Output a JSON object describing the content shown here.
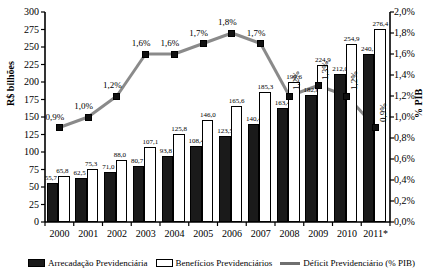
{
  "chart_data": {
    "type": "bar",
    "title": "",
    "xlabel": "",
    "ylabel": "R$ bilhões",
    "y2label": "% PIB",
    "categories": [
      "2000",
      "2001",
      "2002",
      "2003",
      "2004",
      "2005",
      "2006",
      "2007",
      "2008",
      "2009",
      "2010",
      "2011*"
    ],
    "ylim": [
      0,
      300
    ],
    "y2lim": [
      0,
      2.0
    ],
    "yticks": [
      "0",
      "25",
      "50",
      "75",
      "100",
      "125",
      "150",
      "175",
      "200",
      "225",
      "250",
      "275",
      "300"
    ],
    "y2ticks": [
      "0,0%",
      "0,2%",
      "0,4%",
      "0,6%",
      "0,8%",
      "1,0%",
      "1,2%",
      "1,4%",
      "1,6%",
      "1,8%",
      "2,0%"
    ],
    "grid": false,
    "legend_position": "bottom",
    "series": [
      {
        "name": "Arrecadação Previdenciária",
        "type": "bar",
        "color": "#1a1a1a",
        "axis": "left",
        "values": [
          55.7,
          62.5,
          71.0,
          80.7,
          93.8,
          108.4,
          123.5,
          140.4,
          163.4,
          182.0,
          212.0,
          240.1
        ],
        "labels": [
          "55,7",
          "62,5",
          "71,0",
          "80,7",
          "93,8",
          "108,4",
          "123,5",
          "140,4",
          "163,4",
          "182,0",
          "212,0",
          "240,1"
        ]
      },
      {
        "name": "Benefícios Previdenciários",
        "type": "bar",
        "color": "#ffffff",
        "axis": "left",
        "values": [
          65.8,
          75.3,
          88.0,
          107.1,
          125.8,
          146.0,
          165.6,
          185.3,
          199.6,
          224.9,
          254.9,
          276.4
        ],
        "labels": [
          "65,8",
          "75,3",
          "88,0",
          "107,1",
          "125,8",
          "146,0",
          "165,6",
          "185,3",
          "199,6",
          "224,9",
          "254,9",
          "276,4"
        ]
      },
      {
        "name": "Déficit Previdenciário (% PIB)",
        "type": "line",
        "color": "#808080",
        "axis": "right",
        "values": [
          0.9,
          1.0,
          1.2,
          1.6,
          1.6,
          1.7,
          1.8,
          1.7,
          1.2,
          1.3,
          1.2,
          0.9
        ],
        "labels": [
          "0,9%",
          "1,0%",
          "1,2%",
          "1,6%",
          "1,6%",
          "1,7%",
          "1,8%",
          "1,7%",
          "1,2%",
          "1,3%",
          "1,2%",
          "0,9%"
        ]
      }
    ]
  }
}
